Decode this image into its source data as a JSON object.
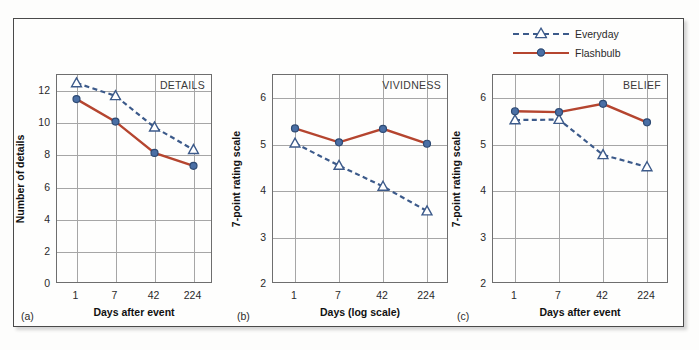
{
  "figure": {
    "legend": {
      "position": "top-right",
      "entries": [
        {
          "label": "Everyday",
          "marker": "open-triangle",
          "line": "dashed",
          "color": "#3c5a8a"
        },
        {
          "label": "Flashbulb",
          "marker": "filled-circle",
          "line": "solid",
          "color": "#b5452f"
        }
      ]
    },
    "colors": {
      "everyday": "#3c5a8a",
      "flashbulb": "#b5452f",
      "grid": "#a6a6a6",
      "axis": "#6e6e6e",
      "frame": "#4a4a4a",
      "background": "#fefefd"
    },
    "panel_letters": [
      "(a)",
      "(b)",
      "(c)"
    ]
  },
  "chart_data": [
    {
      "type": "line",
      "title": "DETAILS",
      "panel": "(a)",
      "xlabel": "Days after event",
      "ylabel": "Number of details",
      "categories": [
        "1",
        "7",
        "42",
        "224"
      ],
      "x_scale": "log (categorical spacing)",
      "ylim": [
        0,
        13
      ],
      "yticks": [
        0,
        2,
        4,
        6,
        8,
        10,
        12
      ],
      "grid": true,
      "series": [
        {
          "name": "Everyday",
          "values": [
            12.5,
            11.7,
            9.75,
            8.35
          ]
        },
        {
          "name": "Flashbulb",
          "values": [
            11.5,
            10.1,
            8.15,
            7.35
          ]
        }
      ]
    },
    {
      "type": "line",
      "title": "VIVIDNESS",
      "panel": "(b)",
      "xlabel": "Days (log scale)",
      "ylabel": "7-point rating scale",
      "categories": [
        "1",
        "7",
        "42",
        "224"
      ],
      "x_scale": "log (categorical spacing)",
      "ylim": [
        2,
        6.5
      ],
      "yticks": [
        2,
        3,
        4,
        5,
        6
      ],
      "grid": true,
      "series": [
        {
          "name": "Everyday",
          "values": [
            5.03,
            4.55,
            4.1,
            3.57
          ]
        },
        {
          "name": "Flashbulb",
          "values": [
            5.35,
            5.05,
            5.34,
            5.02
          ]
        }
      ]
    },
    {
      "type": "line",
      "title": "BELIEF",
      "panel": "(c)",
      "xlabel": "Days after event",
      "ylabel": "7-point rating scale",
      "categories": [
        "1",
        "7",
        "42",
        "224"
      ],
      "x_scale": "log (categorical spacing)",
      "ylim": [
        2,
        6.5
      ],
      "yticks": [
        2,
        3,
        4,
        5,
        6
      ],
      "grid": true,
      "series": [
        {
          "name": "Everyday",
          "values": [
            5.53,
            5.54,
            4.78,
            4.52
          ]
        },
        {
          "name": "Flashbulb",
          "values": [
            5.72,
            5.7,
            5.88,
            5.48
          ]
        }
      ]
    }
  ]
}
